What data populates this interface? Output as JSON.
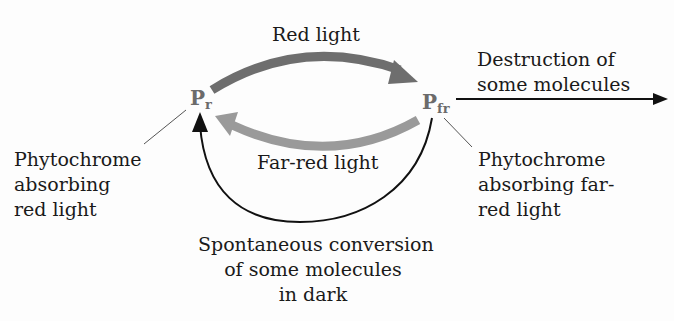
{
  "nodes": {
    "pr": {
      "main": "P",
      "sub": "r"
    },
    "pfr": {
      "main": "P",
      "sub": "fr"
    }
  },
  "labels": {
    "red_light": "Red light",
    "far_red_light": "Far-red light",
    "destruction_line1": "Destruction of",
    "destruction_line2": "some molecules",
    "pr_desc_line1": "Phytochrome",
    "pr_desc_line2": "absorbing",
    "pr_desc_line3": "red light",
    "pfr_desc_line1": "Phytochrome",
    "pfr_desc_line2": "absorbing far-",
    "pfr_desc_line3": "red light",
    "dark_line1": "Spontaneous conversion",
    "dark_line2": "of some molecules",
    "dark_line3": "in dark"
  },
  "colors": {
    "red_arrow": "#6e6e6e",
    "far_red_arrow": "#9a9a9a",
    "black_arrow": "#111111",
    "node_text": "#6b6b6b"
  }
}
